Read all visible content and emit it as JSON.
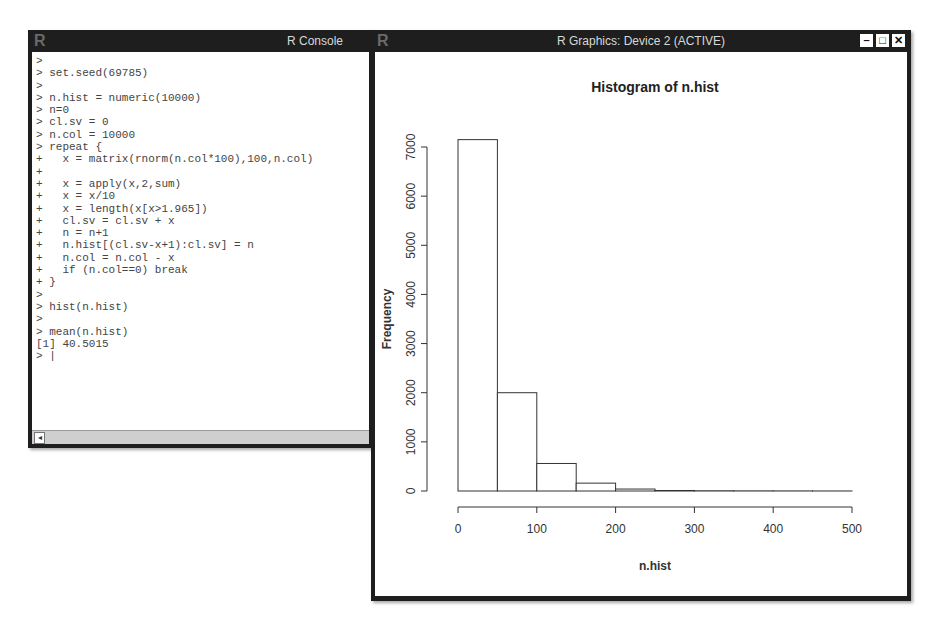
{
  "console": {
    "title": "R Console",
    "logo": "R",
    "lines": [
      ">",
      "> set.seed(69785)",
      ">",
      "> n.hist = numeric(10000)",
      "> n=0",
      "> cl.sv = 0",
      "> n.col = 10000",
      "> repeat {",
      "+   x = matrix(rnorm(n.col*100),100,n.col)",
      "+",
      "+   x = apply(x,2,sum)",
      "+   x = x/10",
      "+   x = length(x[x>1.965])",
      "+   cl.sv = cl.sv + x",
      "+   n = n+1",
      "+   n.hist[(cl.sv-x+1):cl.sv] = n",
      "+   n.col = n.col - x",
      "+   if (n.col==0) break",
      "+ }",
      ">",
      "> hist(n.hist)",
      ">",
      "> mean(n.hist)",
      "[1] 40.5015",
      "> |"
    ],
    "scroll_left_icon": "◂"
  },
  "graphics": {
    "title": "R Graphics: Device 2 (ACTIVE)",
    "logo": "R",
    "controls": {
      "minimize": "–",
      "maximize": "□",
      "close": "✕"
    }
  },
  "chart_data": {
    "type": "bar",
    "title": "Histogram of n.hist",
    "xlabel": "n.hist",
    "ylabel": "Frequency",
    "bins": [
      [
        0,
        50
      ],
      [
        50,
        100
      ],
      [
        100,
        150
      ],
      [
        150,
        200
      ],
      [
        200,
        250
      ],
      [
        250,
        300
      ],
      [
        300,
        350
      ],
      [
        350,
        400
      ],
      [
        400,
        450
      ],
      [
        450,
        500
      ]
    ],
    "categories": [
      "0-50",
      "50-100",
      "100-150",
      "150-200",
      "200-250",
      "250-300",
      "300-350",
      "350-400",
      "400-450",
      "450-500"
    ],
    "values": [
      7150,
      2000,
      560,
      160,
      40,
      10,
      5,
      3,
      2,
      1
    ],
    "xticks": [
      0,
      100,
      200,
      300,
      400,
      500
    ],
    "yticks": [
      0,
      1000,
      2000,
      3000,
      4000,
      5000,
      6000,
      7000
    ],
    "xlim": [
      0,
      500
    ],
    "ylim": [
      0,
      7200
    ],
    "grid": false
  }
}
